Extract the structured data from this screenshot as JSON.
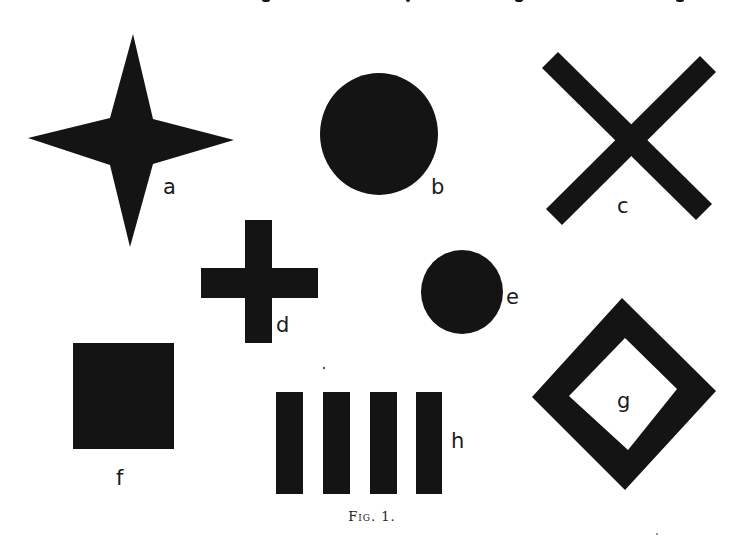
{
  "figure": {
    "caption": "Fig. 1.",
    "ink_color": "#141414",
    "background": "#ffffff",
    "shapes": [
      {
        "id": "a",
        "label": "a",
        "kind": "four-pointed star"
      },
      {
        "id": "b",
        "label": "b",
        "kind": "large filled circle"
      },
      {
        "id": "c",
        "label": "c",
        "kind": "diagonal cross (X)"
      },
      {
        "id": "d",
        "label": "d",
        "kind": "plus cross"
      },
      {
        "id": "e",
        "label": "e",
        "kind": "small filled circle"
      },
      {
        "id": "f",
        "label": "f",
        "kind": "filled square"
      },
      {
        "id": "g",
        "label": "g",
        "kind": "hollow diamond"
      },
      {
        "id": "h",
        "label": "h",
        "kind": "four vertical bars"
      }
    ]
  }
}
